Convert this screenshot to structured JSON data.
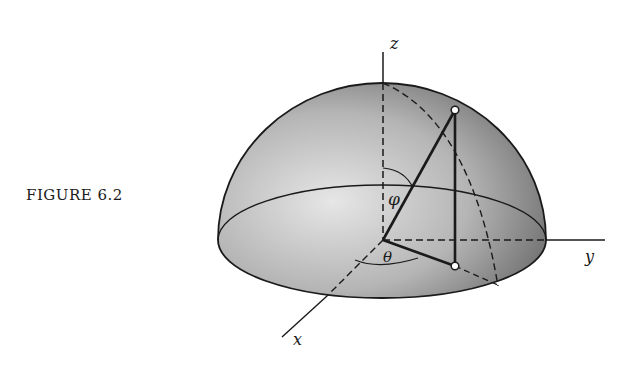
{
  "caption": "FIGURE 6.2",
  "labels": {
    "z_axis": "z",
    "y_axis": "y",
    "x_axis": "x",
    "phi": "φ",
    "theta": "θ"
  },
  "colors": {
    "ink": "#1a1a1a",
    "dome_light": "#e2e2e2",
    "dome_dark": "#6a6a6a"
  }
}
